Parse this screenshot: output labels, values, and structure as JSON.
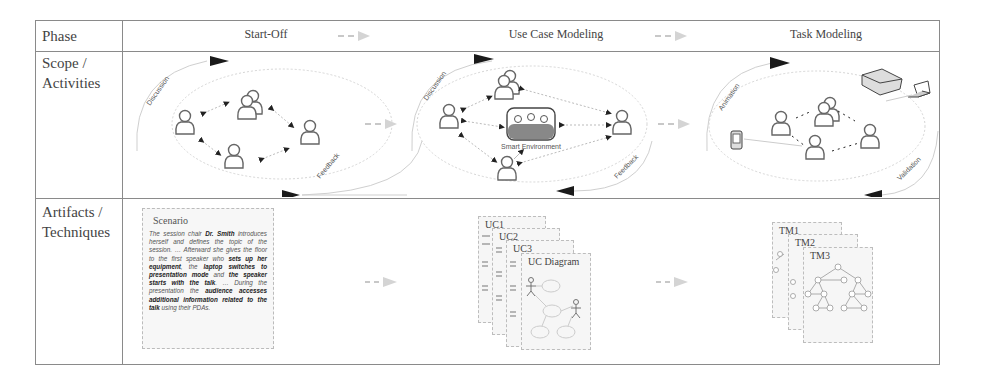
{
  "table": {
    "row_labels": {
      "phase": "Phase",
      "scope_line1": "Scope /",
      "scope_line2": "Activities",
      "artifacts_line1": "Artifacts /",
      "artifacts_line2": "Techniques"
    },
    "phases": [
      {
        "label": "Start-Off"
      },
      {
        "label": "Use Case Modeling"
      },
      {
        "label": "Task Modeling"
      }
    ]
  },
  "scope": {
    "start_off": {
      "top_arc_label": "Discussion",
      "bottom_arc_label": "Feedback"
    },
    "use_case": {
      "top_arc_label": "Discussion",
      "bottom_arc_label": "Feedback",
      "center_label": "Smart Environment"
    },
    "task": {
      "top_arc_label": "Animation",
      "bottom_arc_label": "Validation"
    }
  },
  "artifacts": {
    "scenario": {
      "title": "Scenario",
      "segments": [
        {
          "text": "The session chair ",
          "bold": false
        },
        {
          "text": "Dr. Smith",
          "bold": true
        },
        {
          "text": " introduces herself and defines the topic of the session. … Afterward she gives the floor to the first speaker who ",
          "bold": false
        },
        {
          "text": "sets up her equipment",
          "bold": true
        },
        {
          "text": ", the ",
          "bold": false
        },
        {
          "text": "laptop switches to presentation mode",
          "bold": true
        },
        {
          "text": " and ",
          "bold": false
        },
        {
          "text": "the speaker starts with the talk",
          "bold": true
        },
        {
          "text": ". … During the presentation the ",
          "bold": false
        },
        {
          "text": "audience accesses additional information related to the talk",
          "bold": true
        },
        {
          "text": " using their PDAs.",
          "bold": false
        }
      ]
    },
    "use_case_docs": [
      "UC1",
      "UC2",
      "UC3",
      "UC Diagram"
    ],
    "task_model_docs": [
      "TM1",
      "TM2",
      "TM3"
    ]
  },
  "colors": {
    "border": "#8a8a8a",
    "arrow_dark": "#1a1a1a",
    "arrow_light": "#c8c8c8",
    "ellipse": "#cfcfcf",
    "doc_bg": "#f6f6f6"
  }
}
